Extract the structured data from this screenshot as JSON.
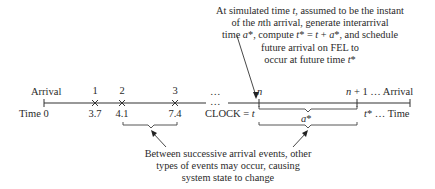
{
  "top_note": {
    "lines": [
      "At simulated time t, assumed to be the instant",
      "of the nth arrival, generate interarrival",
      "time a*, compute t* = t + a*, and schedule",
      "future arrival on FEL to",
      "occur at future time t*"
    ]
  },
  "timeline": {
    "arrival_label": "Arrival",
    "time_label": "Time 0",
    "events": [
      {
        "number": "1",
        "time": "3.7"
      },
      {
        "number": "2",
        "time": "4.1"
      },
      {
        "number": "3",
        "time": "7.4"
      }
    ],
    "ellipsis_top": "…",
    "ellipsis_mid": "…",
    "n_label": "n",
    "clock_label": "CLOCK = ",
    "clock_var": "t",
    "n_plus_one_label": "n + 1",
    "arrival_right_ellipsis": " … Arrival",
    "tstar_label": "t*",
    "time_right_label": " … Time",
    "a_star_label": "a*"
  },
  "bottom_note": {
    "lines": [
      "Between successive arrival events, other",
      "types of events may occur, causing",
      "system state to change"
    ]
  }
}
